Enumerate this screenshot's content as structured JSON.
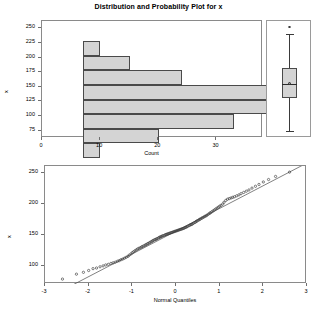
{
  "title": "Distribution and Probability Plot for x",
  "chart_data": [
    {
      "type": "bar",
      "name": "histogram",
      "orientation": "horizontal",
      "title": "Distribution and Probability Plot for x",
      "xlabel": "Count",
      "ylabel": "x",
      "categories": [
        250,
        225,
        200,
        175,
        150,
        125,
        100,
        75
      ],
      "values": [
        3,
        8,
        17,
        34,
        35.5,
        26,
        13,
        3
      ],
      "xlim": [
        0,
        38
      ],
      "ylim": [
        62.5,
        262.5
      ],
      "xticks": [
        0,
        10,
        20,
        30
      ],
      "yticks": [
        250,
        225,
        200,
        175,
        150,
        125,
        100,
        75
      ],
      "grid": false,
      "bar_fill": "#d4d4d4",
      "bar_edge": "#4a4a4a"
    },
    {
      "type": "box",
      "name": "boxplot",
      "ylabel": "x",
      "ylim": [
        62.5,
        262.5
      ],
      "stats": {
        "min_whisker": 75,
        "q1": 130,
        "median": 155,
        "mean": 156,
        "q3": 182,
        "max_whisker": 240,
        "outliers": [
          252
        ]
      },
      "box_fill": "#d4d4d4",
      "box_edge": "#4a4a4a"
    },
    {
      "type": "scatter",
      "name": "normal-probability-plot",
      "xlabel": "Normal Quantiles",
      "ylabel": "x",
      "xlim": [
        -3,
        3
      ],
      "ylim": [
        70,
        262
      ],
      "xticks": [
        -3,
        -2,
        -1,
        0,
        1,
        2,
        3
      ],
      "yticks": [
        100,
        150,
        200,
        250
      ],
      "grid": false,
      "reference_line": {
        "intercept": 156.0,
        "slope": 37.0
      },
      "marker": "open-circle",
      "marker_color": "#3a3a3a",
      "annotations": [
        {
          "label": "low outlier",
          "x": -2.6,
          "y": 78
        }
      ],
      "x": [
        -2.6,
        -2.28,
        -2.12,
        -2.0,
        -1.9,
        -1.82,
        -1.74,
        -1.67,
        -1.61,
        -1.55,
        -1.49,
        -1.44,
        -1.39,
        -1.34,
        -1.3,
        -1.26,
        -1.22,
        -1.18,
        -1.14,
        -1.1,
        -1.07,
        -1.03,
        -1.0,
        -0.97,
        -0.94,
        -0.91,
        -0.88,
        -0.85,
        -0.82,
        -0.79,
        -0.77,
        -0.74,
        -0.71,
        -0.69,
        -0.66,
        -0.64,
        -0.61,
        -0.59,
        -0.56,
        -0.54,
        -0.52,
        -0.49,
        -0.47,
        -0.45,
        -0.43,
        -0.4,
        -0.38,
        -0.36,
        -0.34,
        -0.32,
        -0.3,
        -0.27,
        -0.25,
        -0.23,
        -0.21,
        -0.19,
        -0.17,
        -0.15,
        -0.13,
        -0.11,
        -0.09,
        -0.07,
        -0.05,
        -0.03,
        -0.01,
        0.01,
        0.03,
        0.05,
        0.07,
        0.09,
        0.11,
        0.13,
        0.15,
        0.17,
        0.19,
        0.21,
        0.23,
        0.25,
        0.27,
        0.3,
        0.32,
        0.34,
        0.36,
        0.38,
        0.4,
        0.43,
        0.45,
        0.47,
        0.49,
        0.52,
        0.54,
        0.56,
        0.59,
        0.61,
        0.64,
        0.66,
        0.69,
        0.71,
        0.74,
        0.77,
        0.79,
        0.82,
        0.85,
        0.88,
        0.91,
        0.94,
        0.97,
        1.0,
        1.03,
        1.07,
        1.1,
        1.14,
        1.18,
        1.22,
        1.26,
        1.3,
        1.34,
        1.39,
        1.44,
        1.49,
        1.55,
        1.61,
        1.67,
        1.74,
        1.82,
        1.9,
        2.0,
        2.12,
        2.28,
        2.6
      ],
      "y": [
        78.0,
        86.0,
        89.0,
        92.0,
        95.0,
        96.0,
        98.0,
        99.5,
        101.0,
        102.0,
        103.5,
        104.5,
        105.5,
        107.0,
        108.0,
        109.5,
        110.5,
        112.0,
        113.5,
        115.0,
        117.0,
        119.0,
        121.0,
        122.5,
        124.0,
        125.5,
        127.0,
        128.0,
        129.0,
        130.0,
        131.0,
        132.0,
        133.0,
        134.0,
        135.0,
        136.0,
        137.0,
        138.0,
        139.0,
        140.0,
        141.0,
        142.0,
        142.5,
        143.0,
        144.0,
        145.0,
        146.0,
        146.5,
        147.0,
        148.0,
        148.5,
        149.0,
        150.0,
        150.5,
        151.0,
        151.5,
        152.0,
        152.5,
        153.0,
        153.5,
        154.0,
        154.5,
        155.0,
        155.5,
        156.0,
        156.5,
        157.0,
        157.5,
        158.0,
        158.5,
        159.0,
        159.5,
        160.0,
        160.5,
        161.0,
        162.0,
        162.5,
        163.0,
        164.0,
        165.0,
        166.0,
        166.5,
        167.0,
        168.0,
        169.0,
        170.0,
        171.0,
        172.0,
        173.0,
        174.0,
        175.0,
        176.0,
        177.0,
        178.0,
        179.0,
        180.0,
        181.0,
        182.0,
        183.5,
        185.0,
        186.0,
        187.5,
        189.0,
        190.5,
        192.0,
        193.5,
        195.0,
        196.5,
        198.0,
        200.0,
        203.0,
        206.0,
        208.0,
        209.0,
        210.0,
        211.0,
        212.0,
        213.5,
        215.0,
        217.0,
        219.0,
        221.0,
        223.0,
        226.0,
        229.0,
        232.0,
        236.0,
        240.0,
        245.0,
        252.0
      ]
    }
  ],
  "histogram": {
    "title": "Distribution and Probability Plot for x",
    "xlabel": "Count",
    "ylabel": "x",
    "xticks": [
      "0",
      "10",
      "20",
      "30"
    ],
    "yticks": [
      "250",
      "225",
      "200",
      "175",
      "150",
      "125",
      "100",
      "75"
    ]
  },
  "boxplot": {
    "label": "x"
  },
  "qqplot": {
    "xlabel": "Normal Quantiles",
    "ylabel": "x",
    "xticks": [
      "-3",
      "-2",
      "-1",
      "0",
      "1",
      "2",
      "3"
    ],
    "yticks": [
      "250",
      "200",
      "150",
      "100"
    ]
  }
}
